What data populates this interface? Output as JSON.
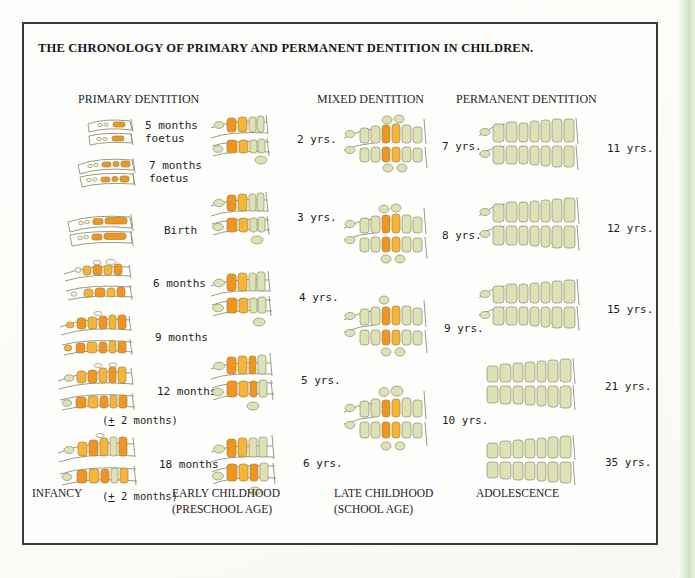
{
  "title": "THE CHRONOLOGY OF PRIMARY AND PERMANENT DENTITION IN CHILDREN.",
  "headers": {
    "primary": "PRIMARY DENTITION",
    "mixed": "MIXED DENTITION",
    "permanent": "PERMANENT DENTITION"
  },
  "colors": {
    "primary_tooth": "#F2951F",
    "permanent_tooth": "#DEE1B4",
    "outline": "#8d8f7c",
    "border": "#3a3a3a",
    "text": "#1b1d20",
    "scan_edge": "#cfe3c0"
  },
  "columns": [
    {
      "name": "primary-dentition",
      "header": "PRIMARY DENTITION",
      "stage": "INFANCY",
      "rows": [
        {
          "label": "5 months",
          "sub": "foetus",
          "tolerance": ""
        },
        {
          "label": "7 months",
          "sub": "foetus",
          "tolerance": ""
        },
        {
          "label": "Birth",
          "sub": "",
          "tolerance": ""
        },
        {
          "label": "6 months",
          "sub": "",
          "tolerance": ""
        },
        {
          "label": "9 months",
          "sub": "",
          "tolerance": ""
        },
        {
          "label": "12 months",
          "sub": "",
          "tolerance": "(+ 2 months)"
        },
        {
          "label": "18 months",
          "sub": "",
          "tolerance": "(+ 2 months)"
        }
      ]
    },
    {
      "name": "early-childhood",
      "header": "",
      "stage": "EARLY CHILDHOOD\n(PRESCHOOL AGE)",
      "rows": [
        {
          "label": "2 yrs.",
          "sub": "",
          "tolerance": ""
        },
        {
          "label": "3 yrs.",
          "sub": "",
          "tolerance": ""
        },
        {
          "label": "4 yrs.",
          "sub": "",
          "tolerance": ""
        },
        {
          "label": "5 yrs.",
          "sub": "",
          "tolerance": ""
        },
        {
          "label": "6 yrs.",
          "sub": "",
          "tolerance": ""
        }
      ]
    },
    {
      "name": "mixed-dentition",
      "header": "MIXED DENTITION",
      "stage": "LATE CHILDHOOD\n(SCHOOL AGE)",
      "rows": [
        {
          "label": "7 yrs.",
          "sub": "",
          "tolerance": ""
        },
        {
          "label": "8 yrs.",
          "sub": "",
          "tolerance": ""
        },
        {
          "label": "9 yrs.",
          "sub": "",
          "tolerance": ""
        },
        {
          "label": "10 yrs.",
          "sub": "",
          "tolerance": ""
        }
      ]
    },
    {
      "name": "permanent-dentition",
      "header": "PERMANENT DENTITION",
      "stage": "ADOLESCENCE",
      "rows": [
        {
          "label": "11 yrs.",
          "sub": "",
          "tolerance": ""
        },
        {
          "label": "12 yrs.",
          "sub": "",
          "tolerance": ""
        },
        {
          "label": "15 yrs.",
          "sub": "",
          "tolerance": ""
        },
        {
          "label": "21 yrs.",
          "sub": "",
          "tolerance": ""
        },
        {
          "label": "35 yrs.",
          "sub": "",
          "tolerance": ""
        }
      ]
    }
  ],
  "footer": {
    "infancy": "INFANCY",
    "early_childhood": "EARLY CHILDHOOD\n(PRESCHOOL AGE)",
    "late_childhood": "LATE CHILDHOOD\n(SCHOOL AGE)",
    "adolescence": "ADOLESCENCE"
  }
}
